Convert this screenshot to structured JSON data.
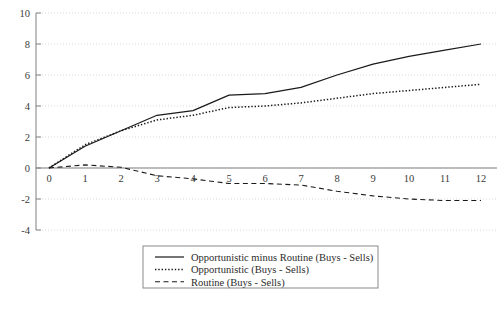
{
  "chart_data": {
    "type": "line",
    "title": "",
    "subtitle": "",
    "xlabel": "",
    "ylabel": "",
    "x": [
      0,
      1,
      2,
      3,
      4,
      5,
      6,
      7,
      8,
      9,
      10,
      11,
      12
    ],
    "xticks": [
      "0",
      "1",
      "2",
      "3",
      "4",
      "5",
      "6",
      "7",
      "8",
      "9",
      "10",
      "11",
      "12"
    ],
    "yticks": [
      "10",
      "8",
      "6",
      "4",
      "2",
      "0",
      "-2",
      "-4"
    ],
    "ytick_values": [
      10,
      8,
      6,
      4,
      2,
      0,
      -2,
      -4
    ],
    "xlim": [
      0,
      12
    ],
    "ylim": [
      -4,
      10
    ],
    "grid": true,
    "grid_style": "dotted-horizontal",
    "legend_position": "below-center",
    "series": [
      {
        "name": "Opportunistic minus Routine (Buys - Sells)",
        "style": "solid",
        "color": "#1a1a1a",
        "values": [
          0,
          1.4,
          2.4,
          3.4,
          3.7,
          4.7,
          4.8,
          5.2,
          6.0,
          6.7,
          7.2,
          7.6,
          8.0
        ]
      },
      {
        "name": "Opportunistic (Buys - Sells)",
        "style": "dotted",
        "color": "#1a1a1a",
        "values": [
          0,
          1.5,
          2.4,
          3.1,
          3.4,
          3.9,
          4.0,
          4.2,
          4.5,
          4.8,
          5.0,
          5.2,
          5.4
        ]
      },
      {
        "name": "Routine (Buys - Sells)",
        "style": "dashed",
        "color": "#1a1a1a",
        "values": [
          0,
          0.2,
          0.05,
          -0.5,
          -0.7,
          -1.0,
          -1.0,
          -1.1,
          -1.5,
          -1.8,
          -2.0,
          -2.1,
          -2.1
        ]
      }
    ],
    "axis_color": "#808080",
    "grid_color": "#d9d9d9",
    "zero_line": true
  },
  "legend": {
    "entries": [
      {
        "label": "Opportunistic minus Routine (Buys - Sells)",
        "style": "solid"
      },
      {
        "label": "Opportunistic (Buys - Sells)",
        "style": "dotted"
      },
      {
        "label": "Routine (Buys - Sells)",
        "style": "dashed"
      }
    ]
  }
}
